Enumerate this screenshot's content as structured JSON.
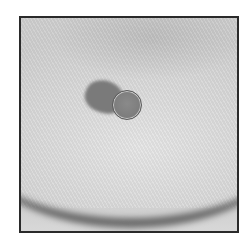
{
  "image": {
    "description": "Grayscale photograph in a square black frame showing a skin surface with a curved fold and a small round dark lesion with an adjacent darker shadow",
    "colors": {
      "frame_border": "#2a2a2a",
      "background": "#dcdcdc",
      "lesion": "#7a7a7a",
      "fold_shadow": "#464646"
    }
  }
}
